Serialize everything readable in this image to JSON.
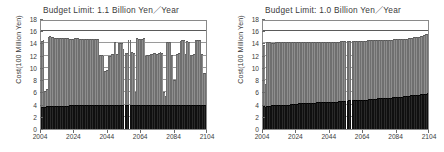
{
  "figure": {
    "panel_count": 2,
    "background_color": "#ffffff"
  },
  "colors": {
    "bar_lower": "#2a2a2a",
    "bar_upper": "#8e8e8e",
    "frame": "#8a8a8a",
    "gridline": "#9a9a9a",
    "text": "#3b3b3b"
  },
  "chart_data": [
    {
      "type": "bar",
      "id": "left-panel",
      "title": "Budget Limit:  1.1 Billion Yen／Year",
      "xlabel": "",
      "ylabel": "Cost(100 Million Yen)",
      "stacked": true,
      "grid": true,
      "legend": "none",
      "ylim": [
        0,
        18
      ],
      "yticks": [
        0,
        2,
        4,
        6,
        8,
        10,
        12,
        14,
        16,
        18
      ],
      "ytick_labels": [
        "0",
        "2",
        "4",
        "6",
        "8",
        "10",
        "12",
        "14",
        "16",
        "18"
      ],
      "xlim": [
        2004,
        2104
      ],
      "xticks": [
        2004,
        2024,
        2044,
        2064,
        2084,
        2104
      ],
      "xtick_labels": [
        "2004",
        "2024",
        "2044",
        "2064",
        "2084",
        "2104"
      ],
      "annotations": [
        {
          "label": "budget limit line",
          "y": 16.0
        }
      ],
      "x": [
        2004,
        2005,
        2006,
        2007,
        2008,
        2009,
        2010,
        2011,
        2012,
        2013,
        2014,
        2015,
        2016,
        2017,
        2018,
        2019,
        2020,
        2021,
        2022,
        2023,
        2024,
        2025,
        2026,
        2027,
        2028,
        2029,
        2030,
        2031,
        2032,
        2033,
        2034,
        2035,
        2036,
        2037,
        2038,
        2039,
        2040,
        2041,
        2042,
        2043,
        2044,
        2045,
        2046,
        2047,
        2048,
        2049,
        2050,
        2051,
        2052,
        2053,
        2054,
        2055,
        2056,
        2057,
        2058,
        2059,
        2060,
        2061,
        2062,
        2063,
        2064,
        2065,
        2066,
        2067,
        2068,
        2069,
        2070,
        2071,
        2072,
        2073,
        2074,
        2075,
        2076,
        2077,
        2078,
        2079,
        2080,
        2081,
        2082,
        2083,
        2084,
        2085,
        2086,
        2087,
        2088,
        2089,
        2090,
        2091,
        2092,
        2093,
        2094,
        2095,
        2096,
        2097,
        2098,
        2099,
        2100,
        2101,
        2102,
        2103
      ],
      "series": [
        {
          "name": "lower-segment",
          "color": "#2a2a2a",
          "values": [
            3.6,
            3.6,
            3.6,
            3.7,
            3.7,
            3.7,
            3.7,
            3.8,
            3.8,
            3.8,
            3.8,
            3.8,
            3.8,
            3.8,
            3.8,
            3.8,
            3.8,
            3.9,
            3.9,
            3.9,
            3.9,
            3.9,
            3.9,
            3.9,
            3.9,
            3.9,
            3.9,
            3.9,
            3.9,
            3.9,
            3.9,
            3.9,
            3.9,
            3.9,
            3.9,
            3.9,
            3.9,
            3.9,
            3.9,
            3.9,
            3.9,
            3.9,
            3.9,
            3.9,
            3.9,
            3.9,
            3.9,
            3.9,
            3.9,
            3.9,
            3.9,
            3.9,
            3.9,
            3.9,
            3.9,
            3.9,
            3.9,
            3.9,
            3.9,
            3.9,
            3.9,
            3.9,
            3.9,
            3.9,
            3.9,
            3.9,
            3.9,
            3.9,
            3.9,
            3.9,
            3.9,
            3.9,
            3.9,
            3.9,
            3.9,
            3.9,
            3.9,
            3.9,
            3.9,
            3.9,
            3.9,
            3.9,
            3.9,
            3.9,
            3.9,
            3.9,
            4.0,
            4.0,
            4.0,
            4.0,
            4.0,
            4.0,
            4.0,
            4.0,
            4.0,
            4.0,
            4.0,
            4.0,
            4.0,
            4.0
          ]
        },
        {
          "name": "total-cost",
          "color": "#8e8e8e",
          "values": [
            14.4,
            14.6,
            6.3,
            6.6,
            15.0,
            15.2,
            15.1,
            15.0,
            14.9,
            14.9,
            14.9,
            14.9,
            14.9,
            14.9,
            14.9,
            14.9,
            14.9,
            14.8,
            14.8,
            14.8,
            14.9,
            14.9,
            14.9,
            14.8,
            14.8,
            14.8,
            14.8,
            14.8,
            14.8,
            14.8,
            14.8,
            14.8,
            14.8,
            14.8,
            14.8,
            12.1,
            12.1,
            12.0,
            9.5,
            9.6,
            12.0,
            12.0,
            12.2,
            12.2,
            14.2,
            12.3,
            14.1,
            14.0,
            14.1,
            13.1,
            12.4,
            12.5,
            14.6,
            14.6,
            12.6,
            12.5,
            6.0,
            14.9,
            14.8,
            14.8,
            14.8,
            14.9,
            12.0,
            12.1,
            12.1,
            12.2,
            12.2,
            12.5,
            12.4,
            12.3,
            12.5,
            12.6,
            12.5,
            6.0,
            5.4,
            14.3,
            14.3,
            14.3,
            12.1,
            8.1,
            8.1,
            12.3,
            12.4,
            14.4,
            14.5,
            14.5,
            12.3,
            14.4,
            14.3,
            12.1,
            12.1,
            12.2,
            14.5,
            14.6,
            14.6,
            14.6,
            12.2,
            9.2,
            9.2,
            14.8
          ]
        }
      ]
    },
    {
      "type": "bar",
      "id": "right-panel",
      "title": "Budget Limit:  1.0 Billion Yen／Year",
      "xlabel": "",
      "ylabel": "Cost(100 Million Yen)",
      "stacked": true,
      "grid": true,
      "legend": "none",
      "ylim": [
        0,
        18
      ],
      "yticks": [
        0,
        2,
        4,
        6,
        8,
        10,
        12,
        14,
        16,
        18
      ],
      "ytick_labels": [
        "0",
        "2",
        "4",
        "6",
        "8",
        "10",
        "12",
        "14",
        "16",
        "18"
      ],
      "xlim": [
        2004,
        2104
      ],
      "xticks": [
        2004,
        2024,
        2044,
        2064,
        2084,
        2104
      ],
      "xtick_labels": [
        "2004",
        "2024",
        "2044",
        "2064",
        "2084",
        "2104"
      ],
      "annotations": [
        {
          "label": "budget limit line",
          "y": 16.0
        }
      ],
      "x": [
        2004,
        2005,
        2006,
        2007,
        2008,
        2009,
        2010,
        2011,
        2012,
        2013,
        2014,
        2015,
        2016,
        2017,
        2018,
        2019,
        2020,
        2021,
        2022,
        2023,
        2024,
        2025,
        2026,
        2027,
        2028,
        2029,
        2030,
        2031,
        2032,
        2033,
        2034,
        2035,
        2036,
        2037,
        2038,
        2039,
        2040,
        2041,
        2042,
        2043,
        2044,
        2045,
        2046,
        2047,
        2048,
        2049,
        2050,
        2051,
        2052,
        2053,
        2054,
        2055,
        2056,
        2057,
        2058,
        2059,
        2060,
        2061,
        2062,
        2063,
        2064,
        2065,
        2066,
        2067,
        2068,
        2069,
        2070,
        2071,
        2072,
        2073,
        2074,
        2075,
        2076,
        2077,
        2078,
        2079,
        2080,
        2081,
        2082,
        2083,
        2084,
        2085,
        2086,
        2087,
        2088,
        2089,
        2090,
        2091,
        2092,
        2093,
        2094,
        2095,
        2096,
        2097,
        2098,
        2099,
        2100,
        2101,
        2102,
        2103
      ],
      "series": [
        {
          "name": "lower-segment",
          "color": "#2a2a2a",
          "values": [
            3.7,
            3.6,
            3.7,
            3.8,
            3.8,
            3.9,
            3.9,
            3.9,
            3.9,
            3.9,
            4.0,
            4.0,
            4.0,
            4.0,
            4.0,
            4.0,
            4.1,
            4.1,
            4.1,
            4.1,
            4.1,
            4.2,
            4.2,
            4.2,
            4.2,
            4.2,
            4.3,
            4.3,
            4.3,
            4.3,
            4.3,
            4.3,
            4.4,
            4.4,
            4.4,
            4.4,
            4.4,
            4.4,
            4.5,
            4.5,
            4.5,
            4.5,
            4.5,
            4.5,
            4.5,
            4.6,
            4.6,
            4.6,
            4.6,
            4.6,
            4.6,
            4.7,
            4.7,
            4.7,
            4.7,
            4.7,
            4.7,
            4.8,
            4.8,
            4.8,
            4.8,
            4.8,
            4.8,
            4.9,
            4.9,
            4.9,
            4.9,
            4.9,
            5.0,
            5.0,
            5.0,
            5.0,
            5.0,
            5.1,
            5.1,
            5.1,
            5.1,
            5.2,
            5.2,
            5.2,
            5.2,
            5.3,
            5.3,
            5.3,
            5.4,
            5.4,
            5.4,
            5.4,
            5.5,
            5.5,
            5.5,
            5.6,
            5.6,
            5.6,
            5.7,
            5.7,
            5.8,
            5.8,
            5.9,
            5.9
          ]
        },
        {
          "name": "total-cost",
          "color": "#8e8e8e",
          "values": [
            13.8,
            7.4,
            14.2,
            14.2,
            14.2,
            14.1,
            14.1,
            14.2,
            14.2,
            14.2,
            14.2,
            14.2,
            14.2,
            14.2,
            14.2,
            14.2,
            14.2,
            14.2,
            14.2,
            14.2,
            14.2,
            14.3,
            14.3,
            14.3,
            14.3,
            14.3,
            14.3,
            14.3,
            14.3,
            14.3,
            14.3,
            14.3,
            14.3,
            14.3,
            14.3,
            14.3,
            14.3,
            14.3,
            14.3,
            14.3,
            14.3,
            14.3,
            14.3,
            14.3,
            14.3,
            14.3,
            14.4,
            14.4,
            14.4,
            14.4,
            14.4,
            14.4,
            14.4,
            14.4,
            14.4,
            14.4,
            14.4,
            14.4,
            14.4,
            14.4,
            14.4,
            14.4,
            14.5,
            14.5,
            14.5,
            14.5,
            14.5,
            14.5,
            14.5,
            14.5,
            14.5,
            14.5,
            14.6,
            14.6,
            14.6,
            14.6,
            14.6,
            14.6,
            14.7,
            14.7,
            14.7,
            14.7,
            14.7,
            14.8,
            14.8,
            14.8,
            14.8,
            14.9,
            14.9,
            14.9,
            15.0,
            15.0,
            15.1,
            15.1,
            15.2,
            15.3,
            15.4,
            15.5,
            15.6,
            15.8
          ]
        }
      ]
    }
  ]
}
